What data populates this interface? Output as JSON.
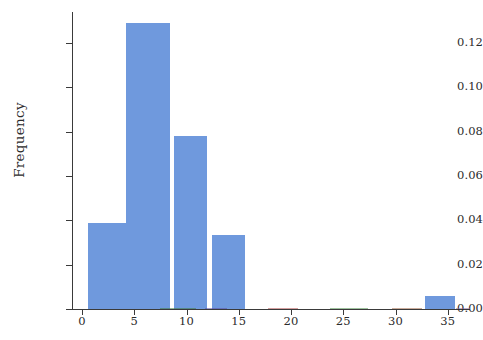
{
  "chart_data": {
    "type": "bar",
    "title": "",
    "subtitle": "",
    "xlabel": "",
    "ylabel": "Frequency",
    "grid": false,
    "legend": null,
    "xlim": [
      -1.5,
      37
    ],
    "ylim": [
      0.0,
      0.135
    ],
    "x_ticks": [
      0,
      5,
      10,
      15,
      20,
      25,
      30,
      35
    ],
    "x_tick_labels": [
      "0",
      "5",
      "10",
      "15",
      "20",
      "25",
      "30",
      "35"
    ],
    "y_ticks": [
      0.0,
      0.02,
      0.04,
      0.06,
      0.08,
      0.1,
      0.12
    ],
    "y_tick_labels": [
      "0.00",
      "0.02",
      "0.04",
      "0.06",
      "0.08",
      "0.10",
      "0.12"
    ],
    "bar_color": "#6f99dd",
    "axis_color": "#3a3a3a",
    "bin_edges": [
      0.6,
      4.6,
      5.2,
      8.8,
      9.6,
      12.4,
      31.8,
      35.2
    ],
    "bars": [
      {
        "label": "0.6-4.6",
        "x_start": 0.6,
        "x_end": 4.6,
        "value": 0.039
      },
      {
        "label": "4.2-8.0",
        "x_start": 4.2,
        "x_end": 8.4,
        "value": 0.129
      },
      {
        "label": "8.8-12.0",
        "x_start": 8.8,
        "x_end": 12.0,
        "value": 0.078
      },
      {
        "label": "12.4-15.6",
        "x_start": 12.4,
        "x_end": 15.6,
        "value": 0.0335
      },
      {
        "label": "32.8-35.7",
        "x_start": 32.8,
        "x_end": 35.7,
        "value": 0.0058
      }
    ],
    "values": [
      0.039,
      0.129,
      0.078,
      0.0335,
      0.0058
    ],
    "categories": [
      "0.6-4.6",
      "4.2-8.4",
      "8.8-12.0",
      "12.4-15.6",
      "32.8-35.7"
    ]
  }
}
